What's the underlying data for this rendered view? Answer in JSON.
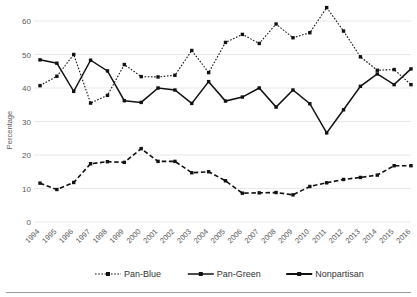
{
  "chart_data": {
    "type": "line",
    "title": "",
    "xlabel": "",
    "ylabel": "Percentage",
    "ylim": [
      0,
      65
    ],
    "yticks": [
      0,
      10,
      20,
      30,
      40,
      50,
      60
    ],
    "grid": true,
    "legend_position": "bottom",
    "categories": [
      "1994",
      "1995",
      "1996",
      "1997",
      "1998",
      "1999",
      "2000",
      "2001",
      "2002",
      "2003",
      "2004",
      "2005",
      "2006",
      "2007",
      "2008",
      "2009",
      "2010",
      "2011",
      "2012",
      "2013",
      "2014",
      "2015",
      "2016"
    ],
    "series": [
      {
        "name": "Pan-Blue",
        "style": "dotted",
        "color": "#111111",
        "values": [
          40.7,
          43.5,
          50.0,
          35.5,
          37.8,
          47.0,
          43.4,
          43.3,
          43.8,
          51.2,
          44.6,
          53.6,
          56.0,
          53.3,
          59.1,
          55.0,
          56.5,
          64.0,
          57.0,
          49.3,
          45.3,
          45.5,
          41.0
        ]
      },
      {
        "name": "Pan-Green",
        "style": "solid",
        "color": "#111111",
        "values": [
          48.4,
          47.4,
          39.0,
          48.3,
          45.1,
          36.2,
          35.7,
          40.0,
          39.4,
          35.4,
          41.9,
          36.1,
          37.3,
          40.0,
          34.3,
          39.4,
          35.3,
          26.6,
          33.5,
          40.5,
          44.2,
          41.0,
          45.7
        ]
      },
      {
        "name": "Nonpartisan",
        "style": "dashed",
        "color": "#111111",
        "values": [
          11.6,
          9.7,
          11.8,
          17.4,
          18.0,
          17.8,
          21.9,
          18.1,
          18.1,
          14.7,
          15.0,
          12.3,
          8.6,
          8.7,
          8.8,
          8.1,
          10.6,
          11.7,
          12.7,
          13.3,
          14.0,
          16.8,
          16.8
        ]
      }
    ],
    "legend": [
      {
        "label": "Pan-Blue",
        "style": "dotted"
      },
      {
        "label": "Pan-Green",
        "style": "solid"
      },
      {
        "label": "Nonpartisan",
        "style": "solid-thick"
      }
    ]
  }
}
